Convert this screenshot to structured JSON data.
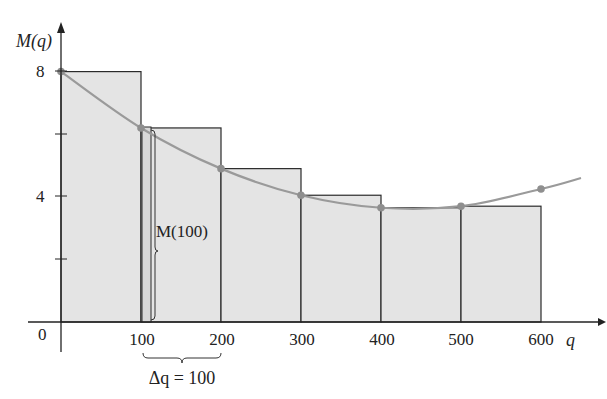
{
  "chart_data": {
    "type": "bar",
    "title": "",
    "xlabel": "q",
    "ylabel": "M(q)",
    "xlim": [
      0,
      600
    ],
    "ylim": [
      0,
      8
    ],
    "grid": false,
    "x_ticks": [
      "0",
      "100",
      "200",
      "300",
      "400",
      "500",
      "600"
    ],
    "y_ticks": [
      "4",
      "8"
    ],
    "y_minor_ticks": [
      2,
      6
    ],
    "bars": {
      "name": "left-endpoint rectangles",
      "categories": [
        "0-100",
        "100-200",
        "200-300",
        "300-400",
        "400-500",
        "500-600"
      ],
      "left": [
        0,
        100,
        200,
        300,
        400,
        500
      ],
      "width": 100,
      "values": [
        8,
        6.2,
        4.9,
        4.05,
        3.65,
        3.7
      ]
    },
    "curve": {
      "name": "M(q)",
      "x": [
        0,
        100,
        200,
        300,
        400,
        500,
        600
      ],
      "y": [
        8,
        6.2,
        4.9,
        4.05,
        3.65,
        3.7,
        4.25
      ],
      "extends_to": [
        650,
        4.6
      ]
    },
    "annotations": [
      {
        "text": "M(100)",
        "target": "height of rectangle at q=100",
        "style": "bracket"
      },
      {
        "text": "Δq = 100",
        "target": "width between q=100 and q=200",
        "style": "underbrace"
      }
    ]
  },
  "labels": {
    "y_axis": "M(q)",
    "x_axis": "q",
    "origin": "0",
    "y8": "8",
    "y4": "4",
    "x100": "100",
    "x200": "200",
    "x300": "300",
    "x400": "400",
    "x500": "500",
    "x600": "600",
    "m100": "M(100)",
    "delta_q": "Δq = 100"
  },
  "colors": {
    "bar_fill": "#e4e4e4",
    "bar_stroke": "#2a2a2a",
    "curve": "#9a9a9a",
    "point": "#8f8f8f",
    "axis": "#222222"
  }
}
